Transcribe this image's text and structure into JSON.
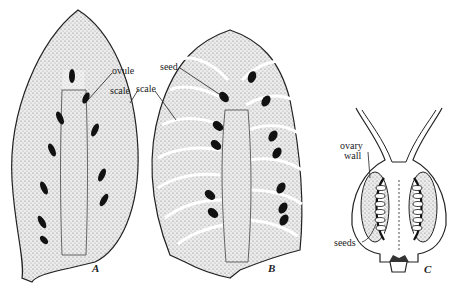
{
  "figures": [
    {
      "id": "A",
      "label": "A",
      "annotations": [
        {
          "text": "ovule"
        },
        {
          "text": "scale"
        }
      ]
    },
    {
      "id": "B",
      "label": "B",
      "annotations": [
        {
          "text": "seed"
        },
        {
          "text": "scale"
        }
      ]
    },
    {
      "id": "C",
      "label": "C",
      "annotations": [
        {
          "text": "ovary"
        },
        {
          "text": "wall"
        },
        {
          "text": "seeds"
        }
      ]
    }
  ],
  "colors": {
    "ink": "#222222",
    "stipple": "#d9d9d9",
    "seed": "#111111",
    "background": "#ffffff"
  }
}
